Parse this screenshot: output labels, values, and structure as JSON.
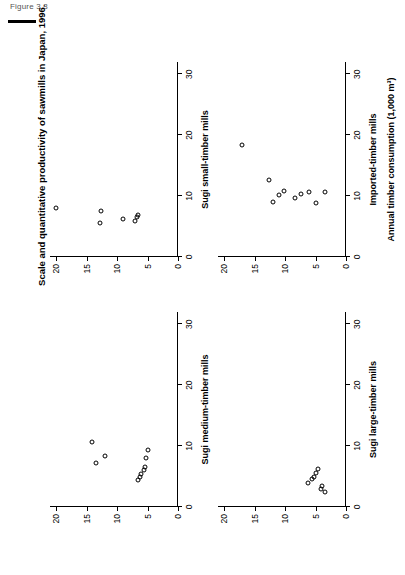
{
  "figure": {
    "number_label": "Figure 3.3",
    "caption": "Scale and quantitative productivity of sawmills in Japan, 1996."
  },
  "chart_data": {
    "type": "scatter",
    "title": "Scale and quantitative productivity of sawmills in Japan, 1996.",
    "xlabel": "Annual timber consumption  (1,000 m³)",
    "ylabel": "Annual timber consumption  per worker (1,000 m³)",
    "xlim": [
      0,
      32
    ],
    "ylim": [
      0,
      21
    ],
    "xticks": [
      0,
      10,
      20,
      30
    ],
    "yticks": [
      0,
      5,
      10,
      15,
      20
    ],
    "grid": false,
    "legend": "none",
    "marker": "open-circle",
    "panels": [
      {
        "id": "sugi-medium-timber-mills",
        "label": "Sugi medium-timber mills",
        "position": "top-left",
        "points": [
          {
            "x": 7.3,
            "y": 13.4
          },
          {
            "x": 8.4,
            "y": 12.0
          },
          {
            "x": 10.6,
            "y": 14.1
          },
          {
            "x": 4.4,
            "y": 6.6
          },
          {
            "x": 5.0,
            "y": 6.2
          },
          {
            "x": 5.4,
            "y": 6.1
          },
          {
            "x": 6.1,
            "y": 5.6
          },
          {
            "x": 6.6,
            "y": 5.4
          },
          {
            "x": 8.1,
            "y": 5.2
          },
          {
            "x": 9.4,
            "y": 5.0
          }
        ]
      },
      {
        "id": "sugi-small-timber-mills",
        "label": "Sugi small-timber mills",
        "position": "top-right",
        "points": [
          {
            "x": 8.0,
            "y": 20.0
          },
          {
            "x": 5.6,
            "y": 12.8
          },
          {
            "x": 7.6,
            "y": 12.6
          },
          {
            "x": 6.3,
            "y": 9.0
          },
          {
            "x": 5.9,
            "y": 7.1
          },
          {
            "x": 6.5,
            "y": 6.8
          },
          {
            "x": 6.9,
            "y": 6.6
          }
        ]
      },
      {
        "id": "sugi-large-timber-mills",
        "label": "Sugi large-timber mills",
        "position": "bottom-left",
        "points": [
          {
            "x": 3.9,
            "y": 6.3
          },
          {
            "x": 4.6,
            "y": 5.6
          },
          {
            "x": 5.0,
            "y": 5.2
          },
          {
            "x": 5.6,
            "y": 4.9
          },
          {
            "x": 6.3,
            "y": 4.6
          },
          {
            "x": 2.9,
            "y": 4.1
          },
          {
            "x": 3.4,
            "y": 3.9
          },
          {
            "x": 2.4,
            "y": 3.4
          }
        ]
      },
      {
        "id": "imported-timber-mills",
        "label": "Imported-timber mills",
        "position": "bottom-right",
        "points": [
          {
            "x": 18.4,
            "y": 17.0
          },
          {
            "x": 12.7,
            "y": 12.6
          },
          {
            "x": 9.1,
            "y": 11.9
          },
          {
            "x": 10.2,
            "y": 11.0
          },
          {
            "x": 10.9,
            "y": 10.2
          },
          {
            "x": 9.7,
            "y": 8.4
          },
          {
            "x": 10.3,
            "y": 7.4
          },
          {
            "x": 10.6,
            "y": 6.0
          },
          {
            "x": 8.8,
            "y": 5.0
          },
          {
            "x": 10.6,
            "y": 3.5
          }
        ]
      }
    ]
  }
}
